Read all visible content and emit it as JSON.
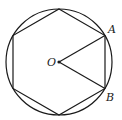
{
  "diagram": {
    "stroke_color": "#1a1a1a",
    "background": "#ffffff",
    "circle": {
      "cx": 59,
      "cy": 62,
      "r": 53
    },
    "hexagon": {
      "vertices": [
        [
          59,
          9
        ],
        [
          105,
          35.5
        ],
        [
          105,
          88.5
        ],
        [
          59,
          115
        ],
        [
          13,
          88.5
        ],
        [
          13,
          35.5
        ]
      ]
    },
    "center_point": {
      "label": "O",
      "x": 59,
      "y": 62
    },
    "radii": [
      {
        "from": "O",
        "to": "A"
      },
      {
        "from": "O",
        "to": "B"
      }
    ],
    "labels": {
      "A": {
        "text": "A",
        "x": 108,
        "y": 33
      },
      "B": {
        "text": "B",
        "x": 106,
        "y": 101
      },
      "O": {
        "text": "O",
        "x": 47,
        "y": 66
      }
    }
  }
}
